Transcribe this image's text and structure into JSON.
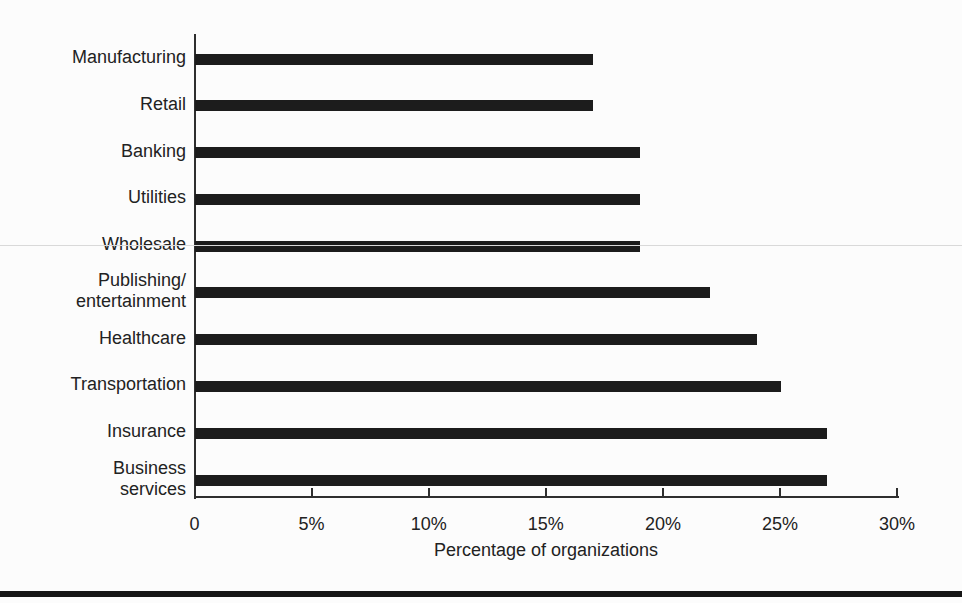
{
  "chart_data": {
    "type": "bar",
    "orientation": "horizontal",
    "title": "",
    "xlabel": "Percentage of organizations",
    "ylabel": "",
    "unit": "%",
    "xlim": [
      0,
      30
    ],
    "grid": "off",
    "legend": "none",
    "categories": [
      "Manufacturing",
      "Retail",
      "Banking",
      "Utilities",
      "Wholesale",
      "Publishing/entertainment",
      "Healthcare",
      "Transportation",
      "Insurance",
      "Business services"
    ],
    "label_lines": [
      [
        "Manufacturing"
      ],
      [
        "Retail"
      ],
      [
        "Banking"
      ],
      [
        "Utilities"
      ],
      [
        "Wholesale"
      ],
      [
        "Publishing/",
        "entertainment"
      ],
      [
        "Healthcare"
      ],
      [
        "Transportation"
      ],
      [
        "Insurance"
      ],
      [
        "Business",
        "services"
      ]
    ],
    "values": [
      17,
      17,
      19,
      19,
      19,
      22,
      24,
      25,
      27,
      27
    ],
    "x_tick_values": [
      0,
      5,
      10,
      15,
      20,
      25,
      30
    ],
    "x_tick_labels": [
      "0",
      "5%",
      "10%",
      "15%",
      "20%",
      "25%",
      "30%"
    ],
    "bar_color": "#1c1c1c"
  },
  "decor": {
    "background": "#fcfcfc",
    "axis_color": "#2e2e2e",
    "text_color": "#222222",
    "bottom_rule_color": "#161616",
    "artifact_line_color": "#d9d9d9"
  }
}
